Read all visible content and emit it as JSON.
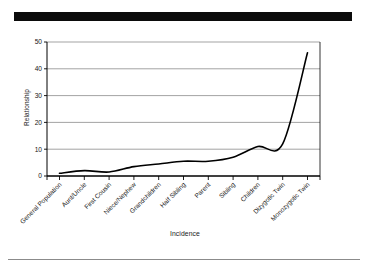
{
  "page": {
    "redaction_bar": "redacted-black-bar",
    "footer_rule": "horizontal-rule"
  },
  "chart_data": {
    "type": "line",
    "title": "",
    "subtitle": "",
    "xlabel": "Incidence",
    "ylabel": "Relationship",
    "categories": [
      "General Population",
      "Aunt/Uncle",
      "First Cousin",
      "Niece/Nephew",
      "Grandchildren",
      "Half Sibling",
      "Parent",
      "Sibling",
      "Children",
      "Dizygotic Twin",
      "Monozygotic Twin"
    ],
    "values": [
      1,
      2,
      1.5,
      3.5,
      4.5,
      5.5,
      5.5,
      7,
      11,
      12,
      46
    ],
    "ylim": [
      0,
      50
    ],
    "yticks": [
      0,
      10,
      20,
      30,
      40,
      50
    ],
    "ytick_labels": [
      "0",
      "10",
      "20",
      "30",
      "40",
      "50"
    ],
    "grid": true,
    "grid_axis": "y",
    "legend": false,
    "legend_position": "none",
    "line_color": "#000000",
    "grid_color": "#999999",
    "axis_color": "#000000",
    "background": "#ffffff"
  }
}
